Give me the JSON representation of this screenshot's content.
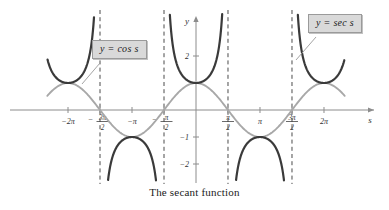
{
  "caption": "The secant function",
  "colors": {
    "secant_curve": "#3a3a3a",
    "cosine_curve": "#a8a8a8",
    "axis": "#8c8c8c",
    "asymptote": "#4a4a4a",
    "callout_bg": "#d9d9d9",
    "callout_border": "#9a9a9a",
    "text": "#1a1a1a"
  },
  "callouts": {
    "cosine": "y = cos s",
    "secant": "y = sec s"
  },
  "axes": {
    "x_axis_label": "s",
    "y_axis_label": "y"
  },
  "x_ticks": [
    {
      "label": "-2π",
      "value": -6.2832,
      "kind": "plain"
    },
    {
      "label": "-3π/2",
      "value": -4.7124,
      "kind": "fraction",
      "sign": "−",
      "num": "3π",
      "den": "2"
    },
    {
      "label": "-π",
      "value": -3.1416,
      "kind": "plain"
    },
    {
      "label": "-π/2",
      "value": -1.5708,
      "kind": "fraction",
      "sign": "−",
      "num": "π",
      "den": "2"
    },
    {
      "label": "π/2",
      "value": 1.5708,
      "kind": "fraction",
      "sign": "",
      "num": "π",
      "den": "2"
    },
    {
      "label": "π",
      "value": 3.1416,
      "kind": "plain"
    },
    {
      "label": "3π/2",
      "value": 4.7124,
      "kind": "fraction",
      "sign": "",
      "num": "3π",
      "den": "2"
    },
    {
      "label": "2π",
      "value": 6.2832,
      "kind": "plain"
    }
  ],
  "y_ticks": [
    {
      "label": "2",
      "value": 2
    },
    {
      "label": "-1",
      "value": -1
    },
    {
      "label": "-2",
      "value": -2
    }
  ],
  "asymptotes": [
    -4.7124,
    -1.5708,
    1.5708,
    4.7124
  ],
  "chart_data": {
    "type": "line",
    "title": "The secant function",
    "xlabel": "s",
    "ylabel": "y",
    "xlim": [
      -7.3,
      7.3
    ],
    "ylim": [
      -3.0,
      3.1
    ],
    "grid": false,
    "legend": "callout-labels",
    "xtick_values": [
      -6.2832,
      -4.7124,
      -3.1416,
      -1.5708,
      1.5708,
      3.1416,
      4.7124,
      6.2832
    ],
    "xtick_labels": [
      "-2π",
      "-3π/2",
      "-π",
      "-π/2",
      "π/2",
      "π",
      "3π/2",
      "2π"
    ],
    "ytick_values": [
      2,
      -1,
      -2
    ],
    "ytick_labels": [
      "2",
      "-1",
      "-2"
    ],
    "vertical_asymptotes": [
      -4.7124,
      -1.5708,
      1.5708,
      4.7124
    ],
    "series": [
      {
        "name": "y = cos s",
        "color": "#a8a8a8",
        "style": "solid",
        "formula": "cos(s)",
        "points": [
          {
            "x": -6.2832,
            "y": 1
          },
          {
            "x": -4.7124,
            "y": 0
          },
          {
            "x": -3.1416,
            "y": -1
          },
          {
            "x": -1.5708,
            "y": 0
          },
          {
            "x": 0,
            "y": 1
          },
          {
            "x": 1.5708,
            "y": 0
          },
          {
            "x": 3.1416,
            "y": -1
          },
          {
            "x": 4.7124,
            "y": 0
          },
          {
            "x": 6.2832,
            "y": 1
          }
        ]
      },
      {
        "name": "y = sec s",
        "color": "#3a3a3a",
        "style": "solid",
        "formula": "sec(s) = 1/cos(s)",
        "branches": [
          {
            "domain": [
              -7.3,
              -4.7124
            ],
            "extremum": {
              "x": -6.2832,
              "y": 1
            }
          },
          {
            "domain": [
              -4.7124,
              -1.5708
            ],
            "extremum": {
              "x": -3.1416,
              "y": -1
            }
          },
          {
            "domain": [
              -1.5708,
              1.5708
            ],
            "extremum": {
              "x": 0,
              "y": 1
            }
          },
          {
            "domain": [
              1.5708,
              4.7124
            ],
            "extremum": {
              "x": 3.1416,
              "y": -1
            }
          },
          {
            "domain": [
              4.7124,
              7.3
            ],
            "extremum": {
              "x": 6.2832,
              "y": 1
            }
          }
        ]
      }
    ],
    "annotations": [
      {
        "text": "y = cos s",
        "target_x": -3.9,
        "target_y": 0.45
      },
      {
        "text": "y = sec s",
        "target_x": 5.6,
        "target_y": 1.9
      }
    ]
  }
}
